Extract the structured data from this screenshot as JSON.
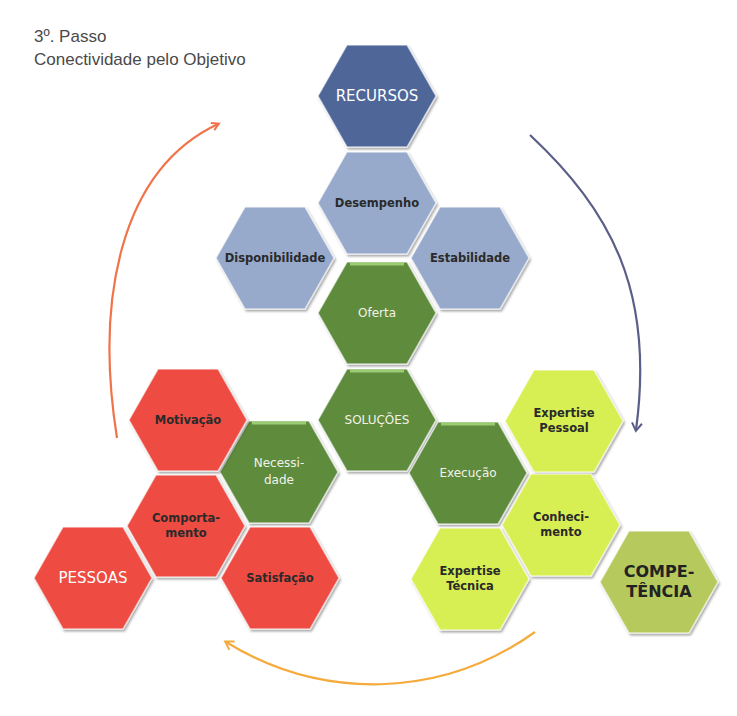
{
  "header": {
    "step": "3º. Passo",
    "subtitle": "Conectividade pelo Objetivo"
  },
  "colors": {
    "recursos": "#4f6699",
    "recursos_children": "#97aacb",
    "solucoes": "#5f8b3e",
    "pessoas": "#ee4b42",
    "competencia_children": "#d8ef52",
    "competencia": "#b6c95c",
    "arrow_orange_red": "#f0744a",
    "arrow_blue": "#5a5e88",
    "arrow_orange": "#f5aa3c"
  },
  "hexagons": [
    {
      "id": "recursos",
      "lines": [
        "RECURSOS"
      ],
      "group": "recursos",
      "style": "big-light",
      "cx": 377,
      "cy": 96
    },
    {
      "id": "desempenho",
      "lines": [
        "Desempenho"
      ],
      "group": "recursos_children",
      "style": "dark",
      "cx": 377,
      "cy": 203
    },
    {
      "id": "disponibilidade",
      "lines": [
        "Disponibilidade"
      ],
      "group": "recursos_children",
      "style": "dark",
      "cx": 275,
      "cy": 258
    },
    {
      "id": "estabilidade",
      "lines": [
        "Estabilidade"
      ],
      "group": "recursos_children",
      "style": "dark",
      "cx": 470,
      "cy": 258
    },
    {
      "id": "oferta",
      "lines": [
        "Oferta"
      ],
      "group": "solucoes",
      "style": "light",
      "cx": 377,
      "cy": 313
    },
    {
      "id": "solucoes",
      "lines": [
        "SOLUÇÕES"
      ],
      "group": "solucoes",
      "style": "light",
      "cx": 377,
      "cy": 420
    },
    {
      "id": "necessidade",
      "lines": [
        "Necessi-",
        "dade"
      ],
      "group": "solucoes",
      "style": "light",
      "cx": 279,
      "cy": 472
    },
    {
      "id": "execucao",
      "lines": [
        "Execução"
      ],
      "group": "solucoes",
      "style": "light",
      "cx": 468,
      "cy": 473
    },
    {
      "id": "motivacao",
      "lines": [
        "Motivação"
      ],
      "group": "pessoas",
      "style": "dark",
      "cx": 188,
      "cy": 420
    },
    {
      "id": "comportamento",
      "lines": [
        "Comporta-",
        "mento"
      ],
      "group": "pessoas",
      "style": "dark",
      "cx": 186,
      "cy": 526
    },
    {
      "id": "pessoas",
      "lines": [
        "PESSOAS"
      ],
      "group": "pessoas",
      "style": "big-light",
      "cx": 93,
      "cy": 578
    },
    {
      "id": "satisfacao",
      "lines": [
        "Satisfação"
      ],
      "group": "pessoas",
      "style": "dark",
      "cx": 280,
      "cy": 578
    },
    {
      "id": "expertise-pessoal",
      "lines": [
        "Expertise",
        "Pessoal"
      ],
      "group": "competencia_children",
      "style": "dark",
      "cx": 564,
      "cy": 421
    },
    {
      "id": "conhecimento",
      "lines": [
        "Conheci-",
        "mento"
      ],
      "group": "competencia_children",
      "style": "dark",
      "cx": 561,
      "cy": 525
    },
    {
      "id": "expertise-tecnica",
      "lines": [
        "Expertise",
        "Técnica"
      ],
      "group": "competencia_children",
      "style": "dark",
      "cx": 470,
      "cy": 579
    },
    {
      "id": "competencia",
      "lines": [
        "COMPE-",
        "TÊNCIA"
      ],
      "group": "competencia",
      "style": "big-dark",
      "cx": 659,
      "cy": 582
    }
  ],
  "arrows": [
    {
      "id": "pessoas-to-recursos",
      "color": "arrow_orange_red",
      "from": "pessoas",
      "to": "recursos"
    },
    {
      "id": "recursos-to-competencia",
      "color": "arrow_blue",
      "from": "recursos",
      "to": "competencia"
    },
    {
      "id": "competencia-to-pessoas",
      "color": "arrow_orange",
      "from": "competencia",
      "to": "pessoas"
    }
  ]
}
